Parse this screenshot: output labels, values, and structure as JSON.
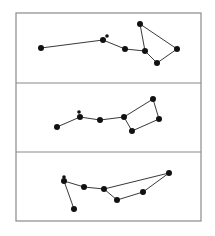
{
  "figure": {
    "frame": {
      "x": 16,
      "y": 13,
      "width": 185,
      "height": 208,
      "stroke": "#8a8a8a"
    },
    "dividers": [
      83,
      152
    ],
    "line_color": "#222222",
    "star_color": "#111111",
    "panels": [
      {
        "name": "panel-top",
        "stars": [
          {
            "x": 41,
            "y": 48,
            "r": 3
          },
          {
            "x": 103,
            "y": 40,
            "r": 3
          },
          {
            "x": 107,
            "y": 36,
            "r": 1.8
          },
          {
            "x": 125,
            "y": 49,
            "r": 3
          },
          {
            "x": 145,
            "y": 51,
            "r": 3
          },
          {
            "x": 140,
            "y": 24,
            "r": 3
          },
          {
            "x": 177,
            "y": 49,
            "r": 3
          },
          {
            "x": 157,
            "y": 63,
            "r": 3
          }
        ],
        "lines": [
          [
            0,
            1
          ],
          [
            1,
            3
          ],
          [
            3,
            4
          ],
          [
            4,
            5
          ],
          [
            5,
            6
          ],
          [
            6,
            7
          ],
          [
            7,
            4
          ]
        ]
      },
      {
        "name": "panel-middle",
        "stars": [
          {
            "x": 57,
            "y": 127,
            "r": 3
          },
          {
            "x": 80,
            "y": 117,
            "r": 3
          },
          {
            "x": 79,
            "y": 112,
            "r": 1.8
          },
          {
            "x": 100,
            "y": 120,
            "r": 3
          },
          {
            "x": 124,
            "y": 117,
            "r": 3
          },
          {
            "x": 153,
            "y": 99,
            "r": 3
          },
          {
            "x": 159,
            "y": 119,
            "r": 3
          },
          {
            "x": 132,
            "y": 131,
            "r": 3
          }
        ],
        "lines": [
          [
            0,
            1
          ],
          [
            1,
            3
          ],
          [
            3,
            4
          ],
          [
            4,
            5
          ],
          [
            5,
            6
          ],
          [
            6,
            7
          ],
          [
            7,
            4
          ]
        ]
      },
      {
        "name": "panel-bottom",
        "stars": [
          {
            "x": 74,
            "y": 209,
            "r": 3
          },
          {
            "x": 64,
            "y": 181,
            "r": 3
          },
          {
            "x": 64,
            "y": 177,
            "r": 1.8
          },
          {
            "x": 84,
            "y": 187,
            "r": 3
          },
          {
            "x": 104,
            "y": 189,
            "r": 3
          },
          {
            "x": 169,
            "y": 173,
            "r": 3
          },
          {
            "x": 143,
            "y": 192,
            "r": 3
          },
          {
            "x": 117,
            "y": 200,
            "r": 3
          }
        ],
        "lines": [
          [
            0,
            1
          ],
          [
            1,
            3
          ],
          [
            3,
            4
          ],
          [
            4,
            5
          ],
          [
            5,
            6
          ],
          [
            6,
            7
          ],
          [
            7,
            4
          ]
        ]
      }
    ]
  }
}
